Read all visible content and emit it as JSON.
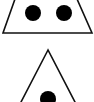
{
  "figures": [
    {
      "name": "top-triangle",
      "dots": 2,
      "points": "15,-1 77,-1 92,33 3,33",
      "dot_positions": [
        [
          33,
          13
        ],
        [
          64,
          13
        ]
      ]
    },
    {
      "name": "bottom-triangle",
      "dots": 1,
      "points": "48,50 20,104 76,104",
      "dot_positions": [
        [
          48,
          99
        ]
      ]
    }
  ],
  "colors": {
    "stroke": "#111111",
    "fill": "#ffffff",
    "dot": "#000000"
  }
}
